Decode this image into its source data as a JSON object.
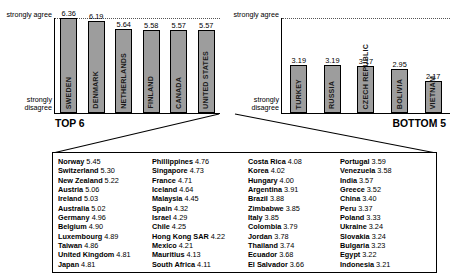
{
  "chart_data": [
    {
      "type": "bar",
      "title": "TOP 6",
      "categories": [
        "SWEDEN",
        "DENMARK",
        "NETHERLANDS",
        "FINLAND",
        "CANADA",
        "UNITED STATES"
      ],
      "values": [
        6.36,
        6.19,
        5.64,
        5.58,
        5.57,
        5.57
      ],
      "ylabel_top": "strongly agree",
      "ylabel_bottom": "strongly disagree",
      "ylim": [
        0,
        6.36
      ],
      "grid": true,
      "xlabel": ""
    },
    {
      "type": "bar",
      "title": "BOTTOM 5",
      "categories": [
        "TURKEY",
        "RUSSIA",
        "CZECH REPUBLIC",
        "BOLIVIA",
        "VIETNAM"
      ],
      "values": [
        3.19,
        3.19,
        3.17,
        2.95,
        2.17
      ],
      "ylabel_top": "strongly agree",
      "ylabel_bottom": "strongly disagree",
      "ylim": [
        0,
        6.36
      ],
      "grid": true,
      "xlabel": ""
    }
  ],
  "left_chart": {
    "axis_top": "strongly agree",
    "axis_bottom": "strongly disagree",
    "group_label": "TOP 6",
    "bars": [
      {
        "name": "SWEDEN",
        "value": "6.36"
      },
      {
        "name": "DENMARK",
        "value": "6.19"
      },
      {
        "name": "NETHERLANDS",
        "value": "5.64"
      },
      {
        "name": "FINLAND",
        "value": "5.58"
      },
      {
        "name": "CANADA",
        "value": "5.57"
      },
      {
        "name": "UNITED STATES",
        "value": "5.57"
      }
    ]
  },
  "right_chart": {
    "axis_top": "strongly agree",
    "axis_bottom": "strongly disagree",
    "group_label": "BOTTOM 5",
    "bars": [
      {
        "name": "TURKEY",
        "value": "3.19"
      },
      {
        "name": "RUSSIA",
        "value": "3.19"
      },
      {
        "name": "CZECH REPUBLIC",
        "value": "3.17"
      },
      {
        "name": "BOLIVIA",
        "value": "2.95"
      },
      {
        "name": "VIETNAM",
        "value": "2.17"
      }
    ]
  },
  "table": {
    "columns": [
      {
        "entries": [
          {
            "name": "Norway",
            "score": "5.45"
          },
          {
            "name": "Switzerland",
            "score": "5.30"
          },
          {
            "name": "New Zealand",
            "score": "5.22"
          },
          {
            "name": "Austria",
            "score": "5.06"
          },
          {
            "name": "Ireland",
            "score": "5.03"
          },
          {
            "name": "Australia",
            "score": "5.02"
          },
          {
            "name": "Germany",
            "score": "4.96"
          },
          {
            "name": "Belgium",
            "score": "4.90"
          },
          {
            "name": "Luxembourg",
            "score": "4.89"
          },
          {
            "name": "Taiwan",
            "score": "4.86"
          },
          {
            "name": "United Kingdom",
            "score": "4.81"
          },
          {
            "name": "Japan",
            "score": "4.81"
          }
        ]
      },
      {
        "entries": [
          {
            "name": "Phillippines",
            "score": "4.76"
          },
          {
            "name": "Singapore",
            "score": "4.73"
          },
          {
            "name": "France",
            "score": "4.71"
          },
          {
            "name": "Iceland",
            "score": "4.64"
          },
          {
            "name": "Malaysia",
            "score": "4.45"
          },
          {
            "name": "Spain",
            "score": "4.32"
          },
          {
            "name": "Israel",
            "score": "4.29"
          },
          {
            "name": "Chile",
            "score": "4.25"
          },
          {
            "name": "Hong Kong SAR",
            "score": "4.22"
          },
          {
            "name": "Mexico",
            "score": "4.21"
          },
          {
            "name": "Mauritius",
            "score": "4.13"
          },
          {
            "name": "South Africa",
            "score": "4.11"
          }
        ]
      },
      {
        "entries": [
          {
            "name": "Costa Rica",
            "score": "4.08"
          },
          {
            "name": "Korea",
            "score": "4.02"
          },
          {
            "name": "Hungary",
            "score": "4.00"
          },
          {
            "name": "Argentina",
            "score": "3.91"
          },
          {
            "name": "Brazil",
            "score": "3.88"
          },
          {
            "name": "Zimbabwe",
            "score": "3.85"
          },
          {
            "name": "Italy",
            "score": "3.85"
          },
          {
            "name": "Colombia",
            "score": "3.79"
          },
          {
            "name": "Jordan",
            "score": "3.78"
          },
          {
            "name": "Thailand",
            "score": "3.74"
          },
          {
            "name": "Ecuador",
            "score": "3.68"
          },
          {
            "name": "El Salvador",
            "score": "3.66"
          }
        ]
      },
      {
        "entries": [
          {
            "name": "Portugal",
            "score": "3.59"
          },
          {
            "name": "Venezuela",
            "score": "3.58"
          },
          {
            "name": "India",
            "score": "3.57"
          },
          {
            "name": "Greece",
            "score": "3.52"
          },
          {
            "name": "China",
            "score": "3.40"
          },
          {
            "name": "Peru",
            "score": "3.37"
          },
          {
            "name": "Poland",
            "score": "3.33"
          },
          {
            "name": "Ukraine",
            "score": "3.24"
          },
          {
            "name": "Slovakia",
            "score": "3.24"
          },
          {
            "name": "Bulgaria",
            "score": "3.23"
          },
          {
            "name": "Egypt",
            "score": "3.22"
          },
          {
            "name": "Indonesia",
            "score": "3.21"
          }
        ]
      }
    ]
  }
}
